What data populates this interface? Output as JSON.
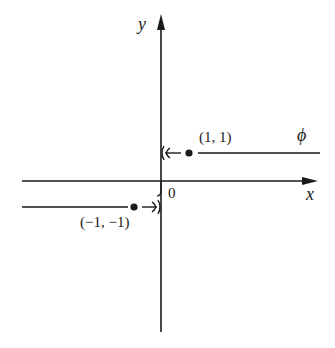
{
  "diagram": {
    "axes": {
      "x_label": "x",
      "y_label": "y",
      "origin_label": "0"
    },
    "points": [
      {
        "label": "(1, 1)",
        "x": 1,
        "y": 1
      },
      {
        "label": "(−1, −1)",
        "x": -1,
        "y": -1
      }
    ],
    "curve_label": "ϕ",
    "colors": {
      "ink": "#1a1a1a",
      "background": "#ffffff"
    }
  }
}
